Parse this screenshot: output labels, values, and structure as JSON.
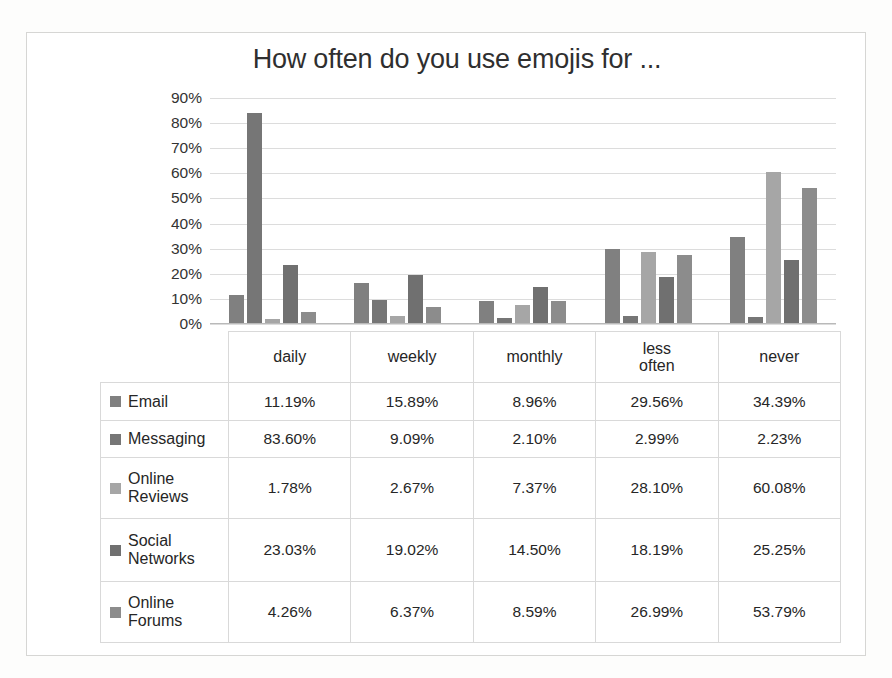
{
  "chart_data": {
    "type": "bar",
    "title": "How often do you use emojis for ...",
    "xlabel": "",
    "ylabel": "",
    "ylim": [
      0,
      90
    ],
    "ytick_labels": [
      "90%",
      "80%",
      "70%",
      "60%",
      "50%",
      "40%",
      "30%",
      "20%",
      "10%",
      "0%"
    ],
    "ytick_values": [
      90,
      80,
      70,
      60,
      50,
      40,
      30,
      20,
      10,
      0
    ],
    "grid": true,
    "legend_position": "table-left-column",
    "value_suffix": "%",
    "categories": [
      "daily",
      "weekly",
      "monthly",
      "less often",
      "never"
    ],
    "category_lines": [
      [
        "daily"
      ],
      [
        "weekly"
      ],
      [
        "monthly"
      ],
      [
        "less",
        "often"
      ],
      [
        "never"
      ]
    ],
    "series": [
      {
        "name": "Email",
        "name_lines": [
          "Email"
        ],
        "color": "#808080",
        "values": [
          11.19,
          15.89,
          8.96,
          29.56,
          34.39
        ],
        "labels": [
          "11.19%",
          "15.89%",
          "8.96%",
          "29.56%",
          "34.39%"
        ]
      },
      {
        "name": "Messaging",
        "name_lines": [
          "Messaging"
        ],
        "color": "#767676",
        "values": [
          83.6,
          9.09,
          2.1,
          2.99,
          2.23
        ],
        "labels": [
          "83.60%",
          "9.09%",
          "2.10%",
          "2.99%",
          "2.23%"
        ]
      },
      {
        "name": "Online Reviews",
        "name_lines": [
          "Online",
          "Reviews"
        ],
        "color": "#a6a6a6",
        "values": [
          1.78,
          2.67,
          7.37,
          28.1,
          60.08
        ],
        "labels": [
          "1.78%",
          "2.67%",
          "7.37%",
          "28.10%",
          "60.08%"
        ]
      },
      {
        "name": "Social Networks",
        "name_lines": [
          "Social",
          "Networks"
        ],
        "color": "#707070",
        "values": [
          23.03,
          19.02,
          14.5,
          18.19,
          25.25
        ],
        "labels": [
          "23.03%",
          "19.02%",
          "14.50%",
          "18.19%",
          "25.25%"
        ]
      },
      {
        "name": "Online Forums",
        "name_lines": [
          "Online",
          "Forums"
        ],
        "color": "#8c8c8c",
        "values": [
          4.26,
          6.37,
          8.59,
          26.99,
          53.79
        ],
        "labels": [
          "4.26%",
          "6.37%",
          "8.59%",
          "26.99%",
          "53.79%"
        ]
      }
    ]
  }
}
